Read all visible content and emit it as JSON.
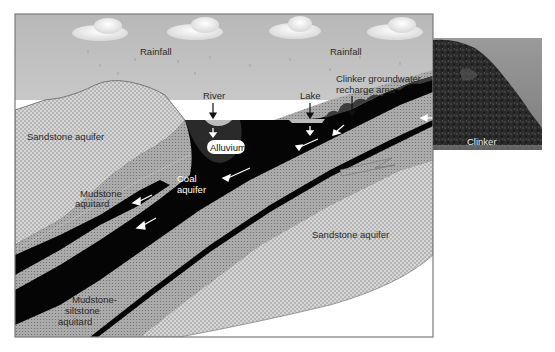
{
  "figure": {
    "type": "hydrogeologic cross-section",
    "colors": {
      "sky_top": "#b9b9b9",
      "sky_bottom": "#f2f2f2",
      "sandstone_fill": "#d6d6d6",
      "sandstone_dots": "#8a8a8a",
      "mudstone_fill": "#a9a9a9",
      "mudstone_dots": "#6e6e6e",
      "coal": "#050505",
      "clinker": "#3c3c3c",
      "frame": "#777777",
      "photo_sky": "#8c8c8c"
    },
    "labels": {
      "rainfall_left": "Rainfall",
      "rainfall_right": "Rainfall",
      "river": "River",
      "lake": "Lake",
      "clinker_recharge_line1": "Clinker groundwater",
      "clinker_recharge_line2": "recharge area",
      "alluvium": "Alluvium",
      "sandstone_aquifer_upper": "Sandstone aquifer",
      "coal_aquifer_line1": "Coal",
      "coal_aquifer_line2": "aquifer",
      "mudstone_aquitard_line1": "Mudstone",
      "mudstone_aquitard_line2": "aquitard",
      "sandstone_aquifer_lower": "Sandstone aquifer",
      "mudstone_siltstone_line1": "Mudstone-",
      "mudstone_siltstone_line2": "siltstone",
      "mudstone_siltstone_line3": "aquitard"
    },
    "photo": {
      "caption": "Clinker"
    },
    "icons": {
      "clouds": [
        "cloud-icon",
        "cloud-icon",
        "cloud-icon",
        "cloud-icon"
      ],
      "flow_arrows": [
        "groundwater-flow-arrow-icon"
      ]
    }
  }
}
